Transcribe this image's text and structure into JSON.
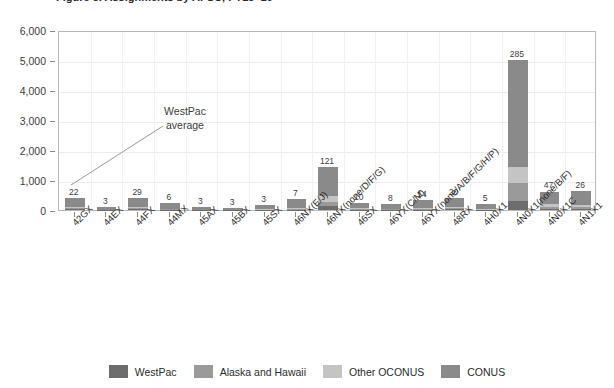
{
  "chart_data": {
    "type": "bar",
    "stacked": true,
    "title": "Figure 5. Assignments by AFSC, FY15–19",
    "xlabel": "",
    "ylabel": "",
    "ylim": [
      0,
      6000
    ],
    "ytick_values": [
      0,
      1000,
      2000,
      3000,
      4000,
      5000,
      6000
    ],
    "ytick_labels": [
      "0",
      "1,000",
      "2,000",
      "3,000",
      "4,000",
      "5,000",
      "6,000"
    ],
    "grid": true,
    "legend_position": "bottom",
    "categories": [
      "42GX",
      "44EX",
      "44FX",
      "44MX",
      "45AX",
      "45BX",
      "45SX",
      "46NX(E/J)",
      "46NX(none/D/F/G)",
      "46SX",
      "46YX(C/M)",
      "46YX(none/A/B/F/G/H/P)",
      "48RX",
      "4H0X1",
      "4N0X1(none/B/F)",
      "4N0X1C",
      "4N1X1"
    ],
    "series": [
      {
        "name": "WestPac",
        "color": "#6d6d6d",
        "values": [
          22,
          3,
          29,
          6,
          3,
          3,
          3,
          7,
          121,
          10,
          8,
          14,
          20,
          5,
          285,
          47,
          26
        ]
      },
      {
        "name": "Alaska and Hawaii",
        "color": "#9a9a9a",
        "values": [
          30,
          6,
          40,
          12,
          6,
          4,
          8,
          25,
          160,
          22,
          14,
          28,
          40,
          12,
          620,
          70,
          60
        ]
      },
      {
        "name": "Other OCONUS",
        "color": "#c4c4c4",
        "values": [
          38,
          8,
          45,
          14,
          8,
          5,
          10,
          30,
          180,
          26,
          16,
          34,
          46,
          14,
          520,
          80,
          70
        ]
      },
      {
        "name": "CONUS",
        "color": "#8a8a8a",
        "values": [
          300,
          95,
          300,
          200,
          95,
          70,
          150,
          290,
          960,
          180,
          160,
          250,
          310,
          160,
          3570,
          420,
          480
        ]
      }
    ],
    "bar_total_labels": [
      "22",
      "3",
      "29",
      "6",
      "3",
      "3",
      "3",
      "7",
      "121",
      "10",
      "8",
      "14",
      "20",
      "5",
      "285",
      "47",
      "26"
    ],
    "annotation": {
      "line1": "WestPac",
      "line2": "average"
    }
  },
  "legend": {
    "items": [
      {
        "label": "WestPac",
        "color": "#6d6d6d"
      },
      {
        "label": "Alaska and Hawaii",
        "color": "#9a9a9a"
      },
      {
        "label": "Other OCONUS",
        "color": "#c4c4c4"
      },
      {
        "label": "CONUS",
        "color": "#8a8a8a"
      }
    ]
  }
}
